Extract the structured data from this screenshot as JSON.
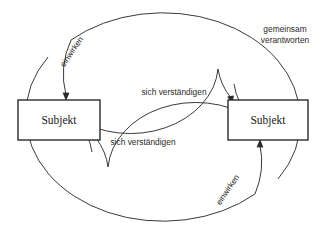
{
  "diagram": {
    "canvas": {
      "width": 331,
      "height": 236,
      "background": "#ffffff"
    },
    "stroke_color": "#2b2b2b",
    "arc_color": "#3a3a3a",
    "nodes": [
      {
        "id": "subjekt-left",
        "label": "Subjekt"
      },
      {
        "id": "subjekt-right",
        "label": "Subjekt"
      }
    ],
    "edge_labels": {
      "outer_top_left": "einwirken",
      "outer_bottom_right": "einwirken",
      "inner_top": "sich verständigen",
      "inner_bottom": "sich verständigen"
    },
    "outer_loop_caption": {
      "line1": "gemeinsam",
      "line2": "verantworten"
    }
  }
}
